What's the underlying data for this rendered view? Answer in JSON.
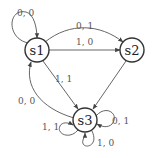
{
  "diagram": {
    "type": "state-machine",
    "nodes": [
      {
        "id": "s1",
        "label": "s1"
      },
      {
        "id": "s2",
        "label": "s2"
      },
      {
        "id": "s3",
        "label": "s3"
      }
    ],
    "edges": [
      {
        "from": "s1",
        "to": "s1",
        "label": "0, 0"
      },
      {
        "from": "s1",
        "to": "s2",
        "label": "0, 1"
      },
      {
        "from": "s1",
        "to": "s2",
        "label": "1, 0"
      },
      {
        "from": "s1",
        "to": "s3",
        "label": "1, 1"
      },
      {
        "from": "s2",
        "to": "s3",
        "label": ""
      },
      {
        "from": "s3",
        "to": "s1",
        "label": "0, 0"
      },
      {
        "from": "s3",
        "to": "s3",
        "label": "0, 1"
      },
      {
        "from": "s3",
        "to": "s3",
        "label": "1, 1"
      },
      {
        "from": "s3",
        "to": "s3",
        "label": "1, 0"
      }
    ]
  }
}
